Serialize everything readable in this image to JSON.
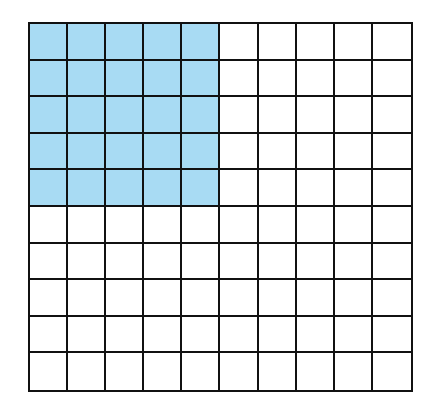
{
  "diagram": {
    "type": "hundred-grid",
    "rows": 10,
    "columns": 10,
    "shaded_rows": 5,
    "shaded_columns": 5,
    "shaded_count": 25,
    "total_cells": 100,
    "colors": {
      "shaded": "#a8dbf3",
      "unshaded": "#ffffff",
      "lines": "#111111"
    }
  }
}
